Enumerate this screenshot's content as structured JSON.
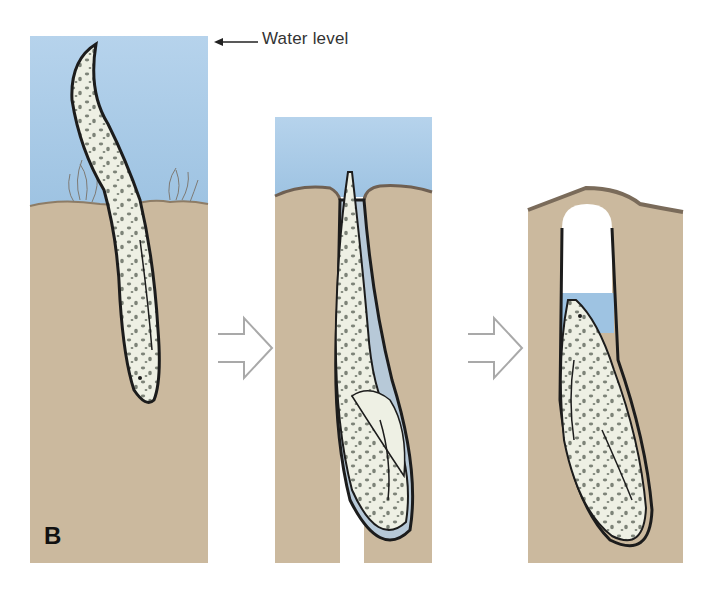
{
  "figure": {
    "panel_label": "B",
    "annotation": {
      "text": "Water level",
      "arrow": "left-arrow"
    },
    "stages": [
      {
        "id": 1,
        "description": "Lungfish in water, burrowing head-first into mud"
      },
      {
        "id": 2,
        "description": "Lungfish turned in U-shaped burrow, water above mud"
      },
      {
        "id": 3,
        "description": "Water receded; lungfish coiled in burrow sealed by mud cap"
      }
    ],
    "transitions": [
      "outline-right-arrow",
      "outline-right-arrow"
    ],
    "colors": {
      "water": "#a9cbe6",
      "soil": "#cbb99e",
      "soil_dark": "#8d7c66",
      "fish_body": "#eef0e4",
      "fish_spots": "#7d8378",
      "outline": "#1c1c1c",
      "arrow_outline": "#a9a9a9"
    }
  }
}
